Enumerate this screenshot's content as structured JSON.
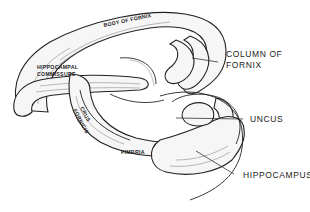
{
  "figure": {
    "background": "#ffffff",
    "ink": "#1a1a1a"
  },
  "labels": {
    "body_of_fornix": "BODY OF FORNIX",
    "hippocampal_commissure_line1": "HIPPOCAMPAL",
    "hippocampal_commissure_line2": "COMMISSURE",
    "crus_fornicis_line1": "CRUS",
    "crus_fornicis_line2": "FORNICIS",
    "fimbria": "FIMBRIA",
    "column_of_fornix_line1": "COLUMN OF",
    "column_of_fornix_line2": "FORNIX",
    "uncus": "UNCUS",
    "hippocampus": "HIPPOCAMPUS"
  }
}
